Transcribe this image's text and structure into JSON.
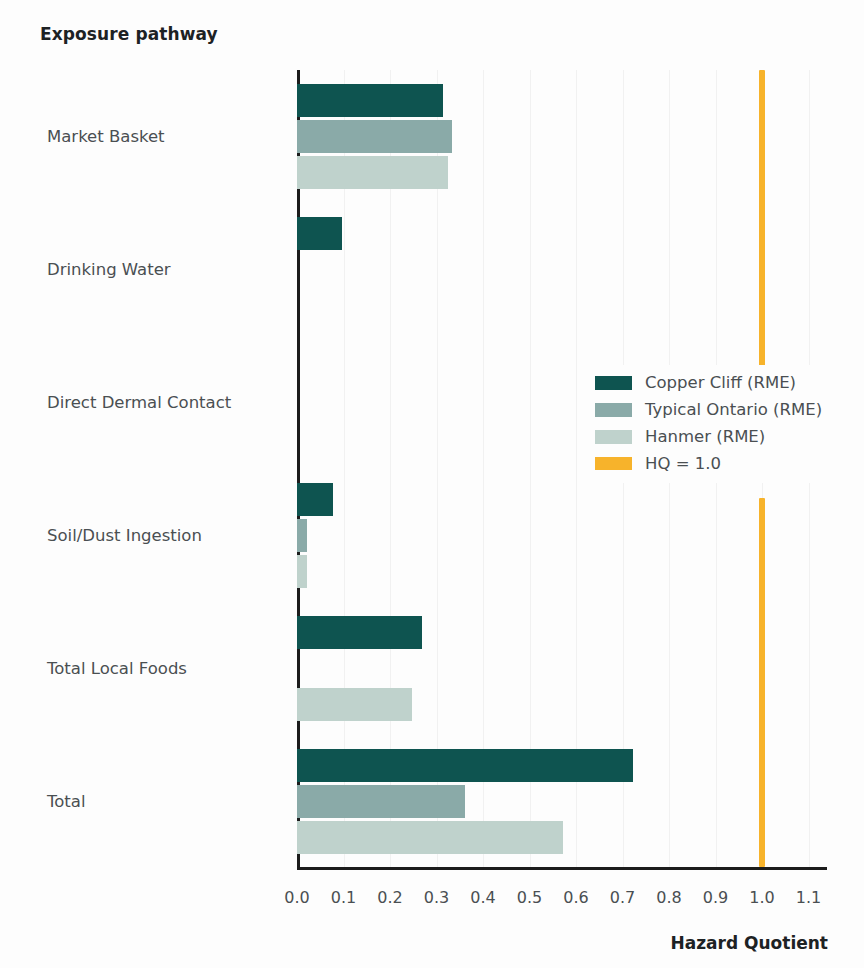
{
  "axis_titles": {
    "y": "Exposure pathway",
    "x": "Hazard Quotient"
  },
  "legend": {
    "items": [
      {
        "label": "Copper Cliff (RME)",
        "color": "#0e5450"
      },
      {
        "label": "Typical Ontario (RME)",
        "color": "#8aaaa8"
      },
      {
        "label": "Hanmer (RME)",
        "color": "#bfd2cc"
      },
      {
        "label": "HQ = 1.0",
        "color": "#f7b32b"
      }
    ]
  },
  "chart_data": {
    "type": "bar",
    "orientation": "horizontal",
    "title": "",
    "xlabel": "Hazard Quotient",
    "ylabel": "Exposure pathway",
    "xlim": [
      0.0,
      1.15
    ],
    "grid": false,
    "legend_position": "center-right",
    "categories": [
      "Market Basket",
      "Drinking Water",
      "Direct Dermal Contact",
      "Soil/Dust Ingestion",
      "Total Local Foods",
      "Total"
    ],
    "series": [
      {
        "name": "Copper Cliff (RME)",
        "color": "#0e5450",
        "values": [
          0.315,
          0.097,
          0.0,
          0.077,
          0.268,
          0.722
        ]
      },
      {
        "name": "Typical Ontario (RME)",
        "color": "#8aaaa8",
        "values": [
          0.333,
          0.0,
          0.0,
          0.021,
          0.0,
          0.361
        ]
      },
      {
        "name": "Hanmer (RME)",
        "color": "#bfd2cc",
        "values": [
          0.325,
          0.0,
          0.0,
          0.021,
          0.247,
          0.572
        ]
      }
    ],
    "annotations": [
      {
        "name": "HQ threshold",
        "type": "vline",
        "value": 1.0,
        "label": "HQ = 1.0",
        "color": "#f7b32b"
      }
    ],
    "xticks": [
      "0.0",
      "0.1",
      "0.2",
      "0.3",
      "0.4",
      "0.5",
      "0.6",
      "0.7",
      "0.8",
      "0.9",
      "1.0",
      "1.1"
    ],
    "xtick_values": [
      0.0,
      0.1,
      0.2,
      0.3,
      0.4,
      0.5,
      0.6,
      0.7,
      0.8,
      0.9,
      1.0,
      1.1
    ]
  }
}
